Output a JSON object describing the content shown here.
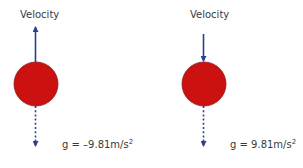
{
  "diagram": {
    "colors": {
      "ball": "#cc1111",
      "ball_outline": "#8a1a1a",
      "arrow": "#2b3f96",
      "text": "#3a3a3a",
      "background": "#ffffff"
    },
    "panels": [
      {
        "id": "left",
        "velocity_label": "Velocity",
        "velocity_direction": "up",
        "gravity_direction": "down",
        "gravity_label_main": "g = –9.81m/s",
        "gravity_label_sup": "2"
      },
      {
        "id": "right",
        "velocity_label": "Velocity",
        "velocity_direction": "down",
        "gravity_direction": "down",
        "gravity_label_main": "g = 9.81m/s",
        "gravity_label_sup": "2"
      }
    ]
  }
}
